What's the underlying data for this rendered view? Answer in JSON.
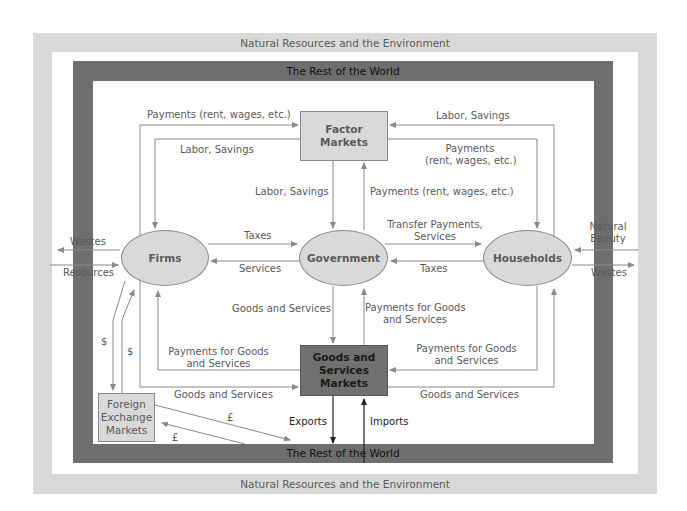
{
  "diagram": {
    "outer_band_label": "Natural Resources and the Environment",
    "world_band_label": "The Rest of the World",
    "colors": {
      "outer_band": "#d9d9d9",
      "world_band": "#6e6e6e",
      "node_fill": "#d9d9d9",
      "dark_node_fill": "#707070",
      "arrow": "#8a8a8a",
      "label_text": "#5a5a5a"
    },
    "nodes": {
      "factor_markets": "Factor Markets",
      "firms": "Firms",
      "government": "Government",
      "households": "Households",
      "goods_services_markets": [
        "Goods and",
        "Services",
        "Markets"
      ],
      "foreign_exchange_markets": [
        "Foreign",
        "Exchange",
        "Markets"
      ]
    },
    "flows": {
      "firms_to_factor_payments": "Payments (rent, wages, etc.)",
      "factor_to_firms_labor": "Labor, Savings",
      "factor_to_gov_labor": "Labor, Savings",
      "households_to_factor_labor": "Labor, Savings",
      "factor_to_households_payments": [
        "Payments",
        "(rent, wages, etc.)"
      ],
      "gov_to_factor_payments": "Payments (rent, wages, etc.)",
      "gov_to_households_transfer": [
        "Transfer Payments,",
        "Services"
      ],
      "firms_to_gov_taxes": "Taxes",
      "gov_to_firms_services": "Services",
      "households_to_gov_taxes": "Taxes",
      "firms_wastes": "Wastes",
      "firms_resources": "Resources",
      "households_natural_beauty": [
        "Natural",
        "Beauty"
      ],
      "households_wastes": "Wastes",
      "markets_to_gov_goods": "Goods and Services",
      "gov_to_markets_payments": [
        "Payments for Goods",
        "and Services"
      ],
      "markets_to_firms_payments": [
        "Payments for Goods",
        "and Services"
      ],
      "households_to_markets_payments": [
        "Payments for Goods",
        "and Services"
      ],
      "firms_to_markets_goods": "Goods and Services",
      "markets_to_households_goods": "Goods and Services",
      "dollar_1": "$",
      "dollar_2": "$",
      "pound_1": "£",
      "pound_2": "£",
      "exports": "Exports",
      "imports": "Imports"
    }
  }
}
